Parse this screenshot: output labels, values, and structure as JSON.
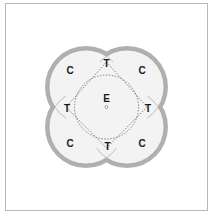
{
  "diagram": {
    "frame_color": "#b8b8b8",
    "ring_color": "#b0b0b0",
    "fill_color": "#f3f3f3",
    "dash_color": "#555555",
    "center_label": "E",
    "corner_labels": [
      "C",
      "C",
      "C",
      "C"
    ],
    "tangent_labels": [
      "T",
      "T",
      "T",
      "T"
    ]
  }
}
